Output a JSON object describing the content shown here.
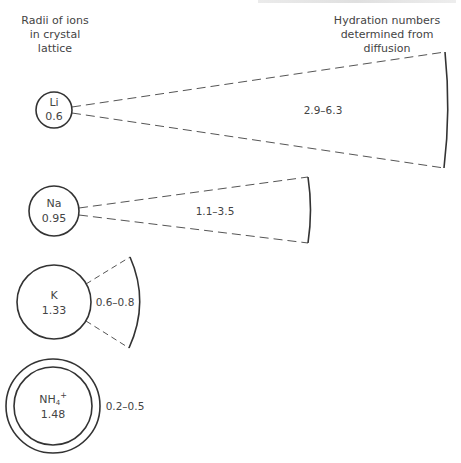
{
  "headings": {
    "left": [
      "Radii of ions",
      "in crystal lattice"
    ],
    "right": [
      "Hydration numbers",
      "determined from diffusion"
    ]
  },
  "ions": [
    {
      "symbol": "Li",
      "radius": "0.6",
      "hydration": "2.9–6.3"
    },
    {
      "symbol": "Na",
      "radius": "0.95",
      "hydration": "1.1–3.5"
    },
    {
      "symbol": "K",
      "radius": "1.33",
      "hydration": "0.6–0.8"
    },
    {
      "symbol": "NH",
      "subscript": "4",
      "superscript": "+",
      "radius": "1.48",
      "hydration": "0.2–0.5"
    }
  ],
  "colors": {
    "stroke": "#333333",
    "dash": "#555555",
    "text": "#444444"
  }
}
